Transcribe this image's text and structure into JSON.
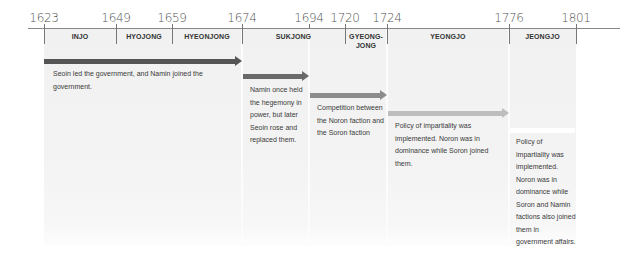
{
  "axis": {
    "years": [
      {
        "label": "1623",
        "x": 44
      },
      {
        "label": "1649",
        "x": 116
      },
      {
        "label": "1659",
        "x": 172
      },
      {
        "label": "1674",
        "x": 242
      },
      {
        "label": "1694",
        "x": 309
      },
      {
        "label": "1720",
        "x": 345
      },
      {
        "label": "1724",
        "x": 387
      },
      {
        "label": "1776",
        "x": 509
      },
      {
        "label": "1801",
        "x": 576
      }
    ]
  },
  "reigns": [
    {
      "name": "INJO",
      "start": "1623",
      "end": "1649"
    },
    {
      "name": "HYOJONG",
      "start": "1649",
      "end": "1659"
    },
    {
      "name": "HYEONJONG",
      "start": "1659",
      "end": "1674"
    },
    {
      "name": "SUKJONG",
      "start": "1674",
      "end": "1720"
    },
    {
      "name": "GYEONG-\nJONG",
      "line1": "GYEONG-",
      "line2": "JONG",
      "start": "1720",
      "end": "1724"
    },
    {
      "name": "YEONGJO",
      "start": "1724",
      "end": "1776"
    },
    {
      "name": "JEONGJO",
      "start": "1776",
      "end": "1801"
    }
  ],
  "periods": [
    {
      "from": "1623",
      "to": "1674",
      "arrow_color": "#555555",
      "text": "Seoin led the government, and Namin joined the government."
    },
    {
      "from": "1674",
      "to": "1694",
      "arrow_color": "#6a6a6a",
      "text": "Namin once held the hegemony in power, but later Seoin rose and replaced them."
    },
    {
      "from": "1694",
      "to": "1724",
      "arrow_color": "#8c8c8c",
      "text": "Competition between the Noron faction and the Soron faction"
    },
    {
      "from": "1724",
      "to": "1776",
      "arrow_color": "#bdbdbd",
      "text": "Policy of impartiality was implemented. Noron was in dominance while Soron joined them."
    },
    {
      "from": "1776",
      "to": "1801",
      "arrow_color": "#ffffff",
      "text": "Policy of impartiality was implemented. Noron was in dominance while Soron and Namin factions also joined them in government affairs."
    }
  ]
}
